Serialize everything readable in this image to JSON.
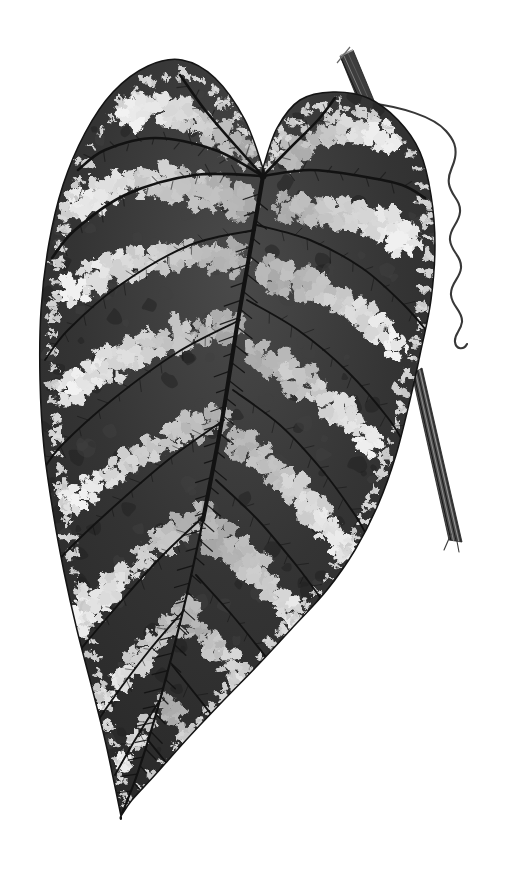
{
  "illustration": {
    "background": "#ffffff",
    "seed": 11,
    "canvas": {
      "width": 524,
      "height": 869
    },
    "colors": {
      "leaf_dark": "#262626",
      "leaf_mid": "#4a4a4a",
      "leaf_deep": "#242424",
      "vein": "#121212",
      "patch_light": "#e8e8e8",
      "margin_dot": "#d2d2d2",
      "mottle_light": "#3f3f3f",
      "mottle_dark": "#1f1f1f",
      "stem": "#3d3d3d",
      "stem_highlight": "#8a8a8a",
      "stalk_fill": "#4f4f4f",
      "tendril": "#383838",
      "outline": "#141414"
    },
    "leaf": {
      "origin": [
        263,
        176
      ],
      "outline": [
        [
          263,
          168
        ],
        [
          245,
          120
        ],
        [
          215,
          78
        ],
        [
          182,
          60
        ],
        [
          148,
          66
        ],
        [
          113,
          92
        ],
        [
          85,
          133
        ],
        [
          63,
          185
        ],
        [
          49,
          243
        ],
        [
          41,
          310
        ],
        [
          40,
          380
        ],
        [
          44,
          448
        ],
        [
          53,
          512
        ],
        [
          64,
          572
        ],
        [
          77,
          630
        ],
        [
          92,
          688
        ],
        [
          105,
          740
        ],
        [
          114,
          782
        ],
        [
          121,
          816
        ],
        [
          121,
          816
        ],
        [
          132,
          800
        ],
        [
          155,
          775
        ],
        [
          188,
          738
        ],
        [
          222,
          702
        ],
        [
          258,
          665
        ],
        [
          295,
          625
        ],
        [
          327,
          590
        ],
        [
          355,
          550
        ],
        [
          378,
          505
        ],
        [
          396,
          455
        ],
        [
          410,
          400
        ],
        [
          421,
          350
        ],
        [
          431,
          300
        ],
        [
          435,
          245
        ],
        [
          431,
          195
        ],
        [
          420,
          152
        ],
        [
          398,
          120
        ],
        [
          368,
          98
        ],
        [
          333,
          92
        ],
        [
          300,
          100
        ],
        [
          277,
          128
        ],
        [
          263,
          168
        ]
      ]
    },
    "veins": {
      "midrib": [
        [
          263,
          176
        ],
        [
          252,
          240
        ],
        [
          238,
          320
        ],
        [
          222,
          420
        ],
        [
          203,
          520
        ],
        [
          182,
          615
        ],
        [
          160,
          700
        ],
        [
          138,
          772
        ],
        [
          121,
          816
        ]
      ],
      "secondary": [
        [
          [
            263,
            176
          ],
          [
            235,
            145
          ],
          [
            205,
            110
          ],
          [
            180,
            75
          ]
        ],
        [
          [
            263,
            176
          ],
          [
            215,
            150
          ],
          [
            155,
            138
          ],
          [
            105,
            150
          ],
          [
            78,
            170
          ]
        ],
        [
          [
            263,
            176
          ],
          [
            195,
            175
          ],
          [
            125,
            195
          ],
          [
            75,
            230
          ],
          [
            52,
            258
          ]
        ],
        [
          [
            263,
            176
          ],
          [
            290,
            148
          ],
          [
            318,
            120
          ],
          [
            335,
            98
          ]
        ],
        [
          [
            263,
            176
          ],
          [
            310,
            170
          ],
          [
            360,
            176
          ],
          [
            402,
            185
          ],
          [
            425,
            198
          ]
        ]
      ],
      "branch": [
        [
          [
            255,
            230
          ],
          [
            190,
            245
          ],
          [
            120,
            285
          ],
          [
            68,
            330
          ],
          [
            45,
            360
          ]
        ],
        [
          [
            240,
            320
          ],
          [
            178,
            352
          ],
          [
            112,
            400
          ],
          [
            62,
            445
          ],
          [
            43,
            470
          ]
        ],
        [
          [
            224,
            420
          ],
          [
            168,
            460
          ],
          [
            108,
            512
          ],
          [
            66,
            552
          ],
          [
            50,
            572
          ]
        ],
        [
          [
            205,
            515
          ],
          [
            158,
            560
          ],
          [
            112,
            612
          ],
          [
            80,
            650
          ],
          [
            68,
            665
          ]
        ],
        [
          [
            184,
            610
          ],
          [
            148,
            652
          ],
          [
            112,
            700
          ],
          [
            92,
            730
          ]
        ],
        [
          [
            160,
            700
          ],
          [
            135,
            740
          ],
          [
            115,
            775
          ]
        ],
        [
          [
            257,
            225
          ],
          [
            310,
            240
          ],
          [
            362,
            268
          ],
          [
            404,
            305
          ],
          [
            430,
            335
          ]
        ],
        [
          [
            247,
            300
          ],
          [
            298,
            330
          ],
          [
            348,
            372
          ],
          [
            388,
            418
          ],
          [
            405,
            445
          ]
        ],
        [
          [
            233,
            390
          ],
          [
            280,
            425
          ],
          [
            322,
            470
          ],
          [
            355,
            515
          ],
          [
            368,
            538
          ]
        ],
        [
          [
            216,
            480
          ],
          [
            258,
            520
          ],
          [
            296,
            565
          ],
          [
            322,
            600
          ],
          [
            332,
            615
          ]
        ],
        [
          [
            196,
            575
          ],
          [
            232,
            615
          ],
          [
            262,
            652
          ],
          [
            280,
            675
          ]
        ],
        [
          [
            172,
            665
          ],
          [
            200,
            700
          ],
          [
            222,
            728
          ]
        ],
        [
          [
            148,
            740
          ],
          [
            168,
            765
          ],
          [
            185,
            788
          ]
        ]
      ]
    },
    "bands": [
      {
        "pts": [
          [
            238,
            148
          ],
          [
            195,
            118
          ],
          [
            150,
            104
          ],
          [
            112,
            116
          ]
        ],
        "r": 17
      },
      {
        "pts": [
          [
            235,
            200
          ],
          [
            178,
            180
          ],
          [
            118,
            180
          ],
          [
            75,
            205
          ]
        ],
        "r": 17
      },
      {
        "pts": [
          [
            230,
            258
          ],
          [
            168,
            252
          ],
          [
            102,
            268
          ],
          [
            60,
            298
          ]
        ],
        "r": 16
      },
      {
        "pts": [
          [
            225,
            325
          ],
          [
            162,
            335
          ],
          [
            98,
            368
          ],
          [
            52,
            398
          ]
        ],
        "r": 16
      },
      {
        "pts": [
          [
            215,
            415
          ],
          [
            158,
            438
          ],
          [
            100,
            478
          ],
          [
            56,
            508
          ]
        ],
        "r": 15
      },
      {
        "pts": [
          [
            202,
            512
          ],
          [
            152,
            545
          ],
          [
            104,
            590
          ],
          [
            72,
            622
          ]
        ],
        "r": 15
      },
      {
        "pts": [
          [
            185,
            608
          ],
          [
            146,
            645
          ],
          [
            108,
            690
          ],
          [
            90,
            715
          ]
        ],
        "r": 13
      },
      {
        "pts": [
          [
            162,
            700
          ],
          [
            136,
            738
          ],
          [
            112,
            772
          ]
        ],
        "r": 11
      },
      {
        "pts": [
          [
            292,
            150
          ],
          [
            322,
            130
          ],
          [
            356,
            124
          ],
          [
            390,
            140
          ]
        ],
        "r": 17
      },
      {
        "pts": [
          [
            284,
            206
          ],
          [
            330,
            212
          ],
          [
            376,
            220
          ],
          [
            410,
            242
          ]
        ],
        "r": 18
      },
      {
        "pts": [
          [
            272,
            272
          ],
          [
            322,
            288
          ],
          [
            368,
            318
          ],
          [
            400,
            350
          ]
        ],
        "r": 16
      },
      {
        "pts": [
          [
            256,
            352
          ],
          [
            305,
            380
          ],
          [
            348,
            418
          ],
          [
            380,
            455
          ]
        ],
        "r": 16
      },
      {
        "pts": [
          [
            238,
            442
          ],
          [
            285,
            478
          ],
          [
            322,
            520
          ],
          [
            348,
            555
          ]
        ],
        "r": 15
      },
      {
        "pts": [
          [
            218,
            535
          ],
          [
            258,
            572
          ],
          [
            292,
            612
          ],
          [
            310,
            635
          ]
        ],
        "r": 15
      },
      {
        "pts": [
          [
            195,
            628
          ],
          [
            228,
            662
          ],
          [
            255,
            695
          ],
          [
            268,
            710
          ]
        ],
        "r": 13
      },
      {
        "pts": [
          [
            170,
            712
          ],
          [
            198,
            745
          ],
          [
            220,
            772
          ]
        ],
        "r": 11
      }
    ],
    "margin": {
      "spacing": 18,
      "inset": 11,
      "radius": 6
    },
    "mottle": {
      "count": 180
    },
    "stem": {
      "poly": [
        [
          340,
          56
        ],
        [
          353,
          50
        ],
        [
          375,
          103
        ],
        [
          362,
          110
        ]
      ],
      "striations": [
        [
          344,
          56,
          366,
          105
        ],
        [
          348,
          53,
          370,
          102
        ],
        [
          341,
          58,
          363,
          107
        ]
      ],
      "cut_line": [
        340,
        56,
        353,
        50
      ],
      "fiber": [
        337,
        63,
        350,
        47
      ]
    },
    "tendril": {
      "path": "M371,103 C400,107 433,116 446,131 C454,140 457,147 455,158 C453,169 447,173 449,184 C451,196 461,200 460,212 C459,224 449,228 450,240 C451,252 462,256 461,268 C460,279 450,283 451,295 C452,307 463,311 462,322 C461,331 454,334 455,342 C456,350 464,350 467,344",
      "width": 2.1
    },
    "stalk": {
      "poly": [
        [
          412,
          374
        ],
        [
          422,
          368
        ],
        [
          462,
          542
        ],
        [
          449,
          540
        ]
      ],
      "top_a": [
        412,
        374
      ],
      "top_b": [
        422,
        368
      ],
      "bot_a": [
        449,
        540
      ],
      "bot_b": [
        462,
        542
      ],
      "fibers": [
        [
          451,
          534,
          444,
          550
        ],
        [
          456,
          536,
          459,
          552
        ]
      ]
    }
  }
}
